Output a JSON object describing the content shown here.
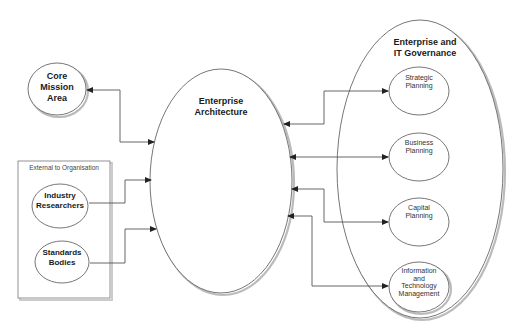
{
  "diagram": {
    "nodes": {
      "core_mission": {
        "label": "Core\nMission\nArea"
      },
      "enterprise_architecture": {
        "label": "Enterprise\nArchitecture"
      },
      "external_group": {
        "label": "External to Organisation",
        "children": {
          "industry": {
            "label": "Industry\nResearchers"
          },
          "standards": {
            "label": "Standards\nBodies"
          }
        }
      },
      "governance": {
        "label": "Enterprise and\nIT Governance",
        "children": {
          "strategic": {
            "label": "Strategic\nPlanning"
          },
          "business": {
            "label": "Business\nPlanning"
          },
          "capital": {
            "label": "Capital\nPlanning"
          },
          "itm": {
            "label": "Information\nand\nTechnology\nManagement"
          }
        }
      }
    },
    "edges": [
      {
        "from": "core_mission",
        "to": "enterprise_architecture",
        "direction": "bidirectional"
      },
      {
        "from": "industry",
        "to": "enterprise_architecture",
        "direction": "forward"
      },
      {
        "from": "standards",
        "to": "enterprise_architecture",
        "direction": "forward"
      },
      {
        "from": "enterprise_architecture",
        "to": "strategic",
        "direction": "bidirectional"
      },
      {
        "from": "enterprise_architecture",
        "to": "business",
        "direction": "bidirectional"
      },
      {
        "from": "enterprise_architecture",
        "to": "capital",
        "direction": "bidirectional"
      },
      {
        "from": "enterprise_architecture",
        "to": "itm",
        "direction": "bidirectional"
      }
    ],
    "colors": {
      "stroke": "#555555",
      "background": "#ffffff",
      "text": "#1a1a1a"
    }
  }
}
